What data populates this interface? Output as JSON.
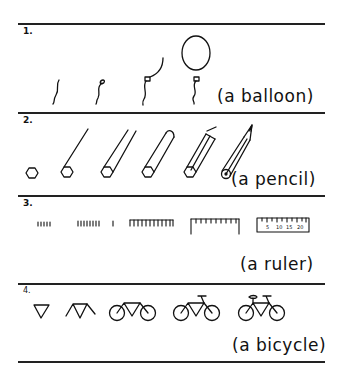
{
  "sections": [
    {
      "number": "1.",
      "caption": "(a balloon)"
    },
    {
      "number": "2.",
      "caption": "(a pencil)"
    },
    {
      "number": "3.",
      "caption": "(a ruler)"
    },
    {
      "number": "4.",
      "caption": "(a bicycle)"
    }
  ],
  "ruler_labels": [
    "5",
    "10",
    "15",
    "20"
  ]
}
